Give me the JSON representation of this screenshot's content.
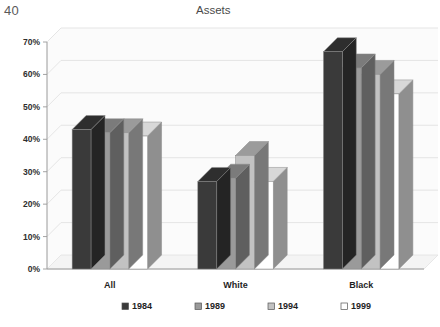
{
  "page": {
    "number": "40"
  },
  "chart_data": {
    "type": "bar",
    "title": "Assets",
    "xlabel": "",
    "ylabel": "",
    "ylim": [
      0,
      70
    ],
    "ytick_labels": [
      "0%",
      "10%",
      "20%",
      "30%",
      "40%",
      "50%",
      "60%",
      "70%"
    ],
    "ytick_values": [
      0,
      10,
      20,
      30,
      40,
      50,
      60,
      70
    ],
    "grid": true,
    "legend_position": "bottom",
    "three_d": true,
    "categories": [
      "All",
      "White",
      "Black"
    ],
    "series": [
      {
        "name": "1984",
        "color": "#3a3a3a",
        "values": [
          43,
          27,
          67
        ]
      },
      {
        "name": "1989",
        "color": "#9a9a9a",
        "values": [
          42,
          28,
          62
        ]
      },
      {
        "name": "1994",
        "color": "#c2c2c2",
        "values": [
          42,
          35,
          60
        ]
      },
      {
        "name": "1999",
        "color": "#ffffff",
        "values": [
          41,
          27,
          54
        ]
      }
    ]
  },
  "colors": {
    "axis": "#9a9a9a",
    "grid": "#e2e2e2",
    "floor": "#f4f4f4",
    "wall": "#fbfbfb",
    "bar_side": "#6f6f6f",
    "bar_outline": "#8a8a8a",
    "text": "#1f1f1f"
  }
}
